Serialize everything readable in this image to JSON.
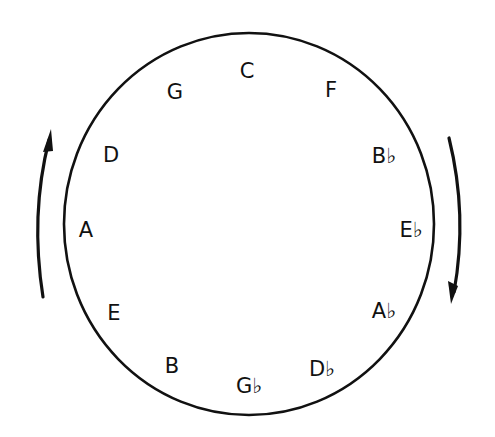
{
  "diagram": {
    "circle": {
      "cx": 249,
      "cy": 224,
      "rx": 185,
      "ry": 191,
      "stroke": "#111111",
      "stroke_width": 2.6
    },
    "notes": [
      {
        "label": "C",
        "x": 247,
        "y": 78
      },
      {
        "label": "F",
        "x": 331,
        "y": 97
      },
      {
        "label": "B♭",
        "x": 384,
        "y": 163
      },
      {
        "label": "E♭",
        "x": 411,
        "y": 237
      },
      {
        "label": "A♭",
        "x": 384,
        "y": 318
      },
      {
        "label": "D♭",
        "x": 322,
        "y": 376
      },
      {
        "label": "G♭",
        "x": 249,
        "y": 393
      },
      {
        "label": "B",
        "x": 172,
        "y": 373
      },
      {
        "label": "E",
        "x": 114,
        "y": 320
      },
      {
        "label": "A",
        "x": 86,
        "y": 237
      },
      {
        "label": "D",
        "x": 111,
        "y": 162
      },
      {
        "label": "G",
        "x": 175,
        "y": 99
      }
    ],
    "arrows": [
      {
        "name": "counterclockwise-arrow",
        "direction": "up",
        "side": "left"
      },
      {
        "name": "clockwise-arrow",
        "direction": "down",
        "side": "right"
      }
    ]
  }
}
